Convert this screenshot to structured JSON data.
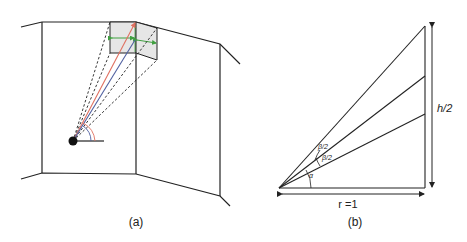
{
  "panels": {
    "a": {
      "caption": "(a)"
    },
    "b": {
      "caption": "(b)",
      "labels": {
        "height": "h/2",
        "radius": "r =1",
        "alpha": "α",
        "beta_upper": "β/2",
        "beta_lower": "β/2"
      }
    }
  },
  "colors": {
    "line": "#222222",
    "red_ray": "#e07060",
    "blue_ray": "#5060a0",
    "green_arrow": "#40a040",
    "screen_fill": "#e6e6e6"
  }
}
